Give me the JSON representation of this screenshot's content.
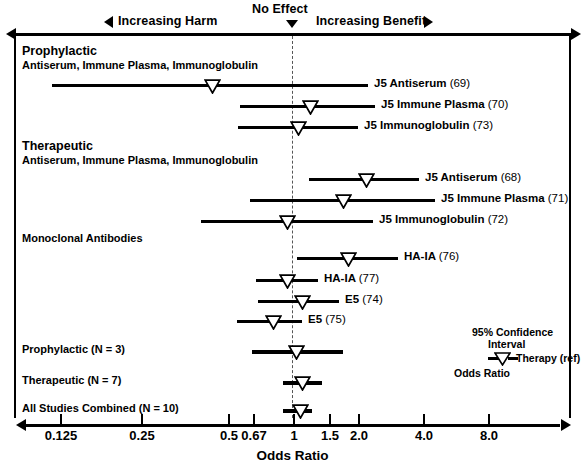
{
  "header": {
    "harm_label": "Increasing Harm",
    "no_effect_label": "No Effect",
    "benefit_label": "Increasing Benefit",
    "harm_arrow_icon": "triangle-left-icon",
    "benefit_arrow_icon": "triangle-right-icon",
    "no_effect_arrow_icon": "triangle-down-icon"
  },
  "legend": {
    "line1": "95% Confidence",
    "line2": "Interval",
    "line3": "Therapy (ref)",
    "line4": "Odds Ratio",
    "marker_icon": "triangle-down-marker-icon"
  },
  "axis": {
    "title": "Odds Ratio",
    "ticks": [
      "0.125",
      "0.25",
      "0.5",
      "0.67",
      "1",
      "1.5",
      "2.0",
      "4.0",
      "8.0"
    ],
    "tick_values": [
      0.125,
      0.25,
      0.5,
      0.67,
      1,
      1.5,
      2.0,
      4.0,
      8.0
    ],
    "tick_x": [
      60,
      141,
      228,
      253,
      293,
      329,
      358,
      423,
      488
    ],
    "null_value": 1
  },
  "groups": [
    {
      "heading": "Prophylactic",
      "subheading": "Antiserum, Immune Plasma, Immunoglobulin"
    },
    {
      "heading": "Therapeutic",
      "subheading": "Antiserum, Immune Plasma, Immunoglobulin"
    },
    {
      "heading": "Monoclonal Antibodies",
      "subheading": ""
    }
  ],
  "chart_data": {
    "type": "forest",
    "title": "",
    "xlabel": "Odds Ratio",
    "ylabel": "",
    "xscale": "log",
    "xlim": [
      0.09,
      12.0
    ],
    "grid": false,
    "null_line": 1,
    "annotations": {
      "left": "Increasing Harm",
      "center": "No Effect",
      "right": "Increasing Benefit"
    },
    "rows": [
      {
        "label": "J5 Antiserum",
        "ref": "(69)",
        "group": "Prophylactic",
        "odds_ratio": 0.43,
        "ci_low": 0.105,
        "ci_high": 1.95,
        "y": 84,
        "x_marker": 212,
        "x_low": 52,
        "x_high": 368,
        "label_x": 374
      },
      {
        "label": "J5 Immune Plasma",
        "ref": "(70)",
        "group": "Prophylactic",
        "odds_ratio": 1.22,
        "ci_low": 0.62,
        "ci_high": 2.1,
        "y": 105,
        "x_marker": 310,
        "x_low": 240,
        "x_high": 375,
        "label_x": 381
      },
      {
        "label": "J5 Immunoglobulin",
        "ref": "(73)",
        "group": "Prophylactic",
        "odds_ratio": 1.08,
        "ci_low": 0.6,
        "ci_high": 1.85,
        "y": 126,
        "x_marker": 298,
        "x_low": 238,
        "x_high": 358,
        "label_x": 364
      },
      {
        "label": "J5 Antiserum",
        "ref": "(68)",
        "group": "Therapeutic",
        "odds_ratio": 2.1,
        "ci_low": 1.2,
        "ci_high": 3.9,
        "y": 178,
        "x_marker": 366,
        "x_low": 309,
        "x_high": 419,
        "label_x": 425
      },
      {
        "label": "J5 Immune Plasma",
        "ref": "(71)",
        "group": "Therapeutic",
        "odds_ratio": 1.75,
        "ci_low": 0.65,
        "ci_high": 4.6,
        "y": 199,
        "x_marker": 343,
        "x_low": 250,
        "x_high": 435,
        "label_x": 441
      },
      {
        "label": "J5 Immunoglobulin",
        "ref": "(72)",
        "group": "Therapeutic",
        "odds_ratio": 0.93,
        "ci_low": 0.36,
        "ci_high": 2.0,
        "y": 220,
        "x_marker": 287,
        "x_low": 201,
        "x_high": 373,
        "label_x": 379
      },
      {
        "label": "HA-IA",
        "ref": "(76)",
        "group": "Monoclonal Antibodies",
        "odds_ratio": 1.75,
        "ci_low": 1.05,
        "ci_high": 2.9,
        "y": 257,
        "x_marker": 348,
        "x_low": 297,
        "x_high": 398,
        "label_x": 404
      },
      {
        "label": "HA-IA",
        "ref": "(77)",
        "group": "Monoclonal Antibodies",
        "odds_ratio": 0.93,
        "ci_low": 0.7,
        "ci_high": 1.3,
        "y": 279,
        "x_marker": 287,
        "x_low": 256,
        "x_high": 318,
        "label_x": 324
      },
      {
        "label": "E5",
        "ref": "(74)",
        "group": "Monoclonal Antibodies",
        "odds_ratio": 1.1,
        "ci_low": 0.72,
        "ci_high": 1.55,
        "y": 300,
        "x_marker": 302,
        "x_low": 258,
        "x_high": 339,
        "label_x": 345
      },
      {
        "label": "E5",
        "ref": "(75)",
        "group": "Monoclonal Antibodies",
        "odds_ratio": 0.8,
        "ci_low": 0.62,
        "ci_high": 1.1,
        "y": 320,
        "x_marker": 273,
        "x_low": 237,
        "x_high": 302,
        "label_x": 308
      }
    ],
    "summary_rows": [
      {
        "label": "Prophylactic (N = 3)",
        "odds_ratio": 1.03,
        "ci_low": 0.67,
        "ci_high": 1.7,
        "y": 350,
        "x_marker": 296,
        "x_low": 252,
        "x_high": 343,
        "label_x": 22
      },
      {
        "label": "Therapeutic (N = 7)",
        "odds_ratio": 1.12,
        "ci_low": 0.95,
        "ci_high": 1.35,
        "y": 381,
        "x_marker": 302,
        "x_low": 283,
        "x_high": 322,
        "label_x": 22
      },
      {
        "label": "All Studies Combined (N = 10)",
        "odds_ratio": 1.1,
        "ci_low": 0.95,
        "ci_high": 1.25,
        "y": 409,
        "x_marker": 300,
        "x_low": 283,
        "x_high": 312,
        "label_x": 22
      }
    ]
  }
}
